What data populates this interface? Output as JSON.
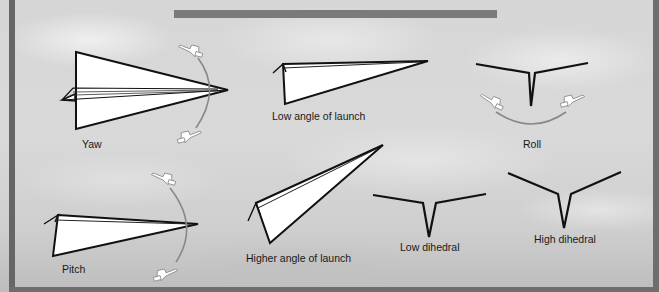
{
  "figure": {
    "title_bar_color": "#7a7a7a",
    "frame_color": "#6a6a6a",
    "labels": {
      "yaw": "Yaw",
      "low_angle": "Low angle of launch",
      "roll": "Roll",
      "pitch": "Pitch",
      "higher_angle": "Higher angle of launch",
      "low_dihedral": "Low dihedral",
      "high_dihedral": "High dihedral"
    },
    "icons": [
      "paper-airplane-top-view",
      "paper-airplane-side-view",
      "paper-airplane-front-view",
      "pointing-hand-icon",
      "rotation-arc"
    ]
  }
}
